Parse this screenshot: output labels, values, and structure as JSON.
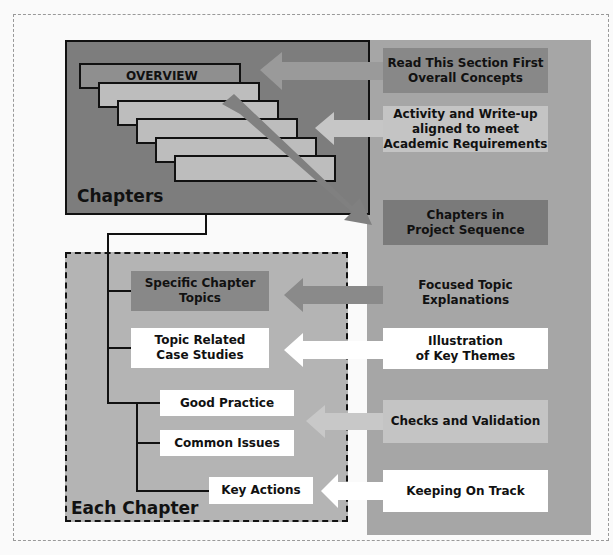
{
  "diagram": {
    "left_panel": {
      "chapters_title": "Chapters",
      "overview_label": "OVERVIEW",
      "each_chapter_title": "Each Chapter",
      "chapter_items": [
        {
          "label_line1": "Specific Chapter",
          "label_line2": "Topics"
        },
        {
          "label_line1": "Topic Related",
          "label_line2": "Case Studies"
        },
        {
          "label": "Good Practice"
        },
        {
          "label": "Common Issues"
        },
        {
          "label": "Key Actions"
        }
      ]
    },
    "right_panel": {
      "items": [
        {
          "line1": "Read This Section First",
          "line2": "Overall Concepts"
        },
        {
          "line1": "Activity and Write-up",
          "line2": "aligned to meet",
          "line3": "Academic Requirements"
        },
        {
          "line1": "Chapters in",
          "line2": "Project Sequence"
        },
        {
          "line1": "Focused Topic",
          "line2": "Explanations"
        },
        {
          "line1": "Illustration",
          "line2": "of Key Themes"
        },
        {
          "line1": "Checks and Validation"
        },
        {
          "line1": "Keeping On Track"
        }
      ]
    },
    "colors": {
      "dark_panel": "#7d7d7d",
      "mid_gray": "#888888",
      "light_gray": "#c4c4c4",
      "right_column": "#a6a6a6",
      "white": "#ffffff"
    }
  }
}
